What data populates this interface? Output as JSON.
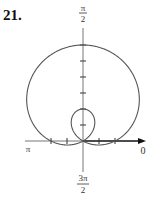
{
  "problem": {
    "number": "21."
  },
  "axes": {
    "top_label": {
      "num": "π",
      "den": "2"
    },
    "bottom_label": {
      "num": "3π",
      "den": "2"
    },
    "left_label": "π",
    "right_label": "0"
  },
  "colors": {
    "curve": "#555555",
    "axis": "#666666",
    "axis_bold": "#111111",
    "text": "#333333"
  },
  "chart_data": {
    "type": "polar",
    "title": "21.",
    "equation": "r = 1 + 2 sin θ",
    "curve": "limaçon with inner loop",
    "angle_labels": [
      "0",
      "π/2",
      "π",
      "3π/2"
    ],
    "radial_ticks_per_unit": 2,
    "outer_loop_max_r": 3,
    "inner_loop_max_r": 1,
    "axis_crossings": {
      "theta_0": 1,
      "theta_pi": 1
    },
    "grid": false
  }
}
